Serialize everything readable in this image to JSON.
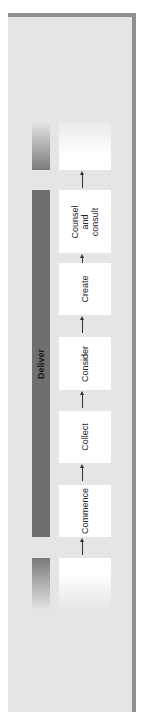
{
  "diagram": {
    "phase_label": "Deliver",
    "steps": [
      {
        "label": "Commence"
      },
      {
        "label": "Collect"
      },
      {
        "label": "Consider"
      },
      {
        "label": "Create"
      },
      {
        "label": "Counsel\nand\nconsult"
      }
    ],
    "flow_direction": "bottom-to-top (rotated)",
    "colors": {
      "panel": "#e5e5e5",
      "panel_shadow": "#8f8f8f",
      "phase_bar": "#6f6f6f",
      "step_box": "#ffffff",
      "arrow": "#333333"
    }
  }
}
